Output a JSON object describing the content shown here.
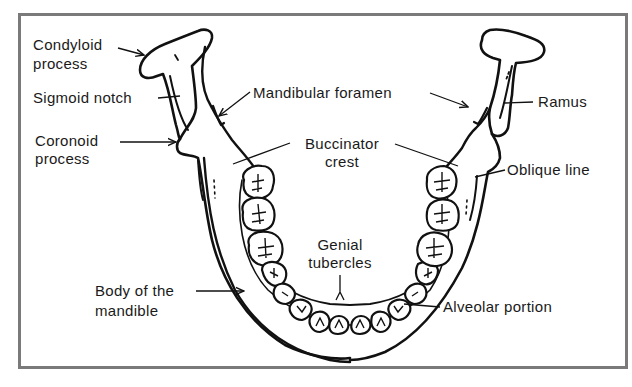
{
  "diagram": {
    "border_color": "#7a7a7a",
    "line_color": "#111111",
    "labels": {
      "condyloid_process": {
        "line1": "Condyloid",
        "line2": "process"
      },
      "sigmoid_notch": "Sigmoid notch",
      "coronoid_process": {
        "line1": "Coronoid",
        "line2": "process"
      },
      "mandibular_foramen": "Mandibular foramen",
      "ramus": "Ramus",
      "buccinator_crest": {
        "line1": "Buccinator",
        "line2": "crest"
      },
      "oblique_line": "Oblique line",
      "genial_tubercles": {
        "line1": "Genial",
        "line2": "tubercles"
      },
      "body_of_mandible": {
        "line1": "Body of the",
        "line2": "mandible"
      },
      "alveolar_portion": "Alveolar portion"
    }
  }
}
